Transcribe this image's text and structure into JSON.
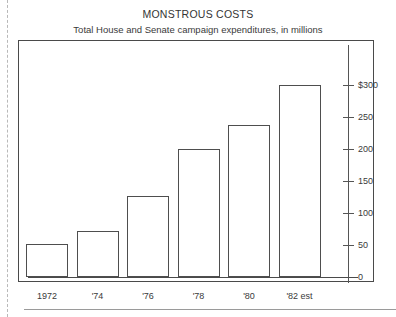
{
  "chart_data": {
    "type": "bar",
    "title": "MONSTROUS COSTS",
    "subtitle": "Total House and Senate campaign expenditures, in millions",
    "xlabel": "",
    "ylabel": "",
    "categories": [
      "1972",
      "'74",
      "'76",
      "'78",
      "'80",
      "'82 est"
    ],
    "values": [
      52,
      72,
      126,
      200,
      238,
      300
    ],
    "ylim": [
      0,
      300
    ],
    "yticks": [
      0,
      50,
      100,
      150,
      200,
      250,
      300
    ],
    "ytick_labels": [
      "0",
      "50",
      "100",
      "150",
      "200",
      "250",
      "$300"
    ],
    "grid": false,
    "legend": false,
    "axis_position": "right",
    "bar_style": "outline",
    "bar_fill_color": "#ffffff",
    "bar_edge_color": "#4e4e4e",
    "frame_color": "#4a4a4a",
    "text_color": "#3a3a3a"
  }
}
